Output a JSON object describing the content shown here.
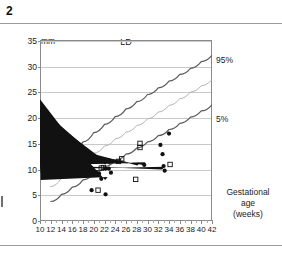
{
  "figure": {
    "number": "2",
    "unit_label": "mm",
    "title": "LD",
    "axis_caption_line1": "Gestational",
    "axis_caption_line2": "age",
    "axis_caption_line3": "(weeks)",
    "label_upper": "95%",
    "label_lower": "5%"
  },
  "chart_data": {
    "type": "scatter",
    "title": "LD",
    "xlabel": "Gestational age (weeks)",
    "ylabel": "mm",
    "xlim": [
      10,
      42
    ],
    "ylim": [
      0,
      35
    ],
    "xticks": [
      10,
      12,
      14,
      16,
      18,
      20,
      22,
      24,
      26,
      28,
      30,
      32,
      34,
      36,
      38,
      40,
      42
    ],
    "yticks": [
      0,
      5,
      10,
      15,
      20,
      25,
      30,
      35
    ],
    "grid": "horizontal",
    "legend": "none",
    "annotations": [
      "95%",
      "5%"
    ],
    "series": [
      {
        "name": "95%",
        "type": "line",
        "color": "#5a5a5a",
        "x": [
          12,
          14,
          16,
          18,
          20,
          22,
          24,
          26,
          28,
          30,
          32,
          34,
          36,
          38,
          40,
          42
        ],
        "y": [
          9.2,
          11.4,
          13.4,
          15.2,
          17.0,
          18.6,
          20.1,
          21.6,
          23.0,
          24.4,
          25.7,
          27.0,
          28.3,
          29.5,
          30.8,
          32.0
        ]
      },
      {
        "name": "50%",
        "type": "line",
        "color": "#b4b4b4",
        "x": [
          12,
          14,
          16,
          18,
          20,
          22,
          24,
          26,
          28,
          30,
          32,
          34,
          36,
          38,
          40,
          42
        ],
        "y": [
          6.5,
          8.2,
          9.9,
          11.5,
          13.0,
          14.4,
          15.8,
          17.1,
          18.4,
          19.7,
          21.0,
          22.3,
          23.6,
          24.9,
          26.1,
          27.3
        ]
      },
      {
        "name": "5%",
        "type": "line",
        "color": "#5a5a5a",
        "x": [
          12,
          14,
          16,
          18,
          20,
          22,
          24,
          26,
          28,
          30,
          32,
          34,
          36,
          38,
          40,
          42
        ],
        "y": [
          3.6,
          5.0,
          6.4,
          7.8,
          9.1,
          10.4,
          11.6,
          12.8,
          14.0,
          15.2,
          16.4,
          17.6,
          18.8,
          20.0,
          21.2,
          22.4
        ]
      },
      {
        "name": "filled-circle-observations",
        "type": "scatter",
        "marker": "filled-circle",
        "color": "#111111",
        "points": [
          [
            19.6,
            5.8
          ],
          [
            22.2,
            5.0
          ],
          [
            21.0,
            9.0
          ],
          [
            21.4,
            8.0
          ],
          [
            22.2,
            10.0
          ],
          [
            22.8,
            10.0
          ],
          [
            23.2,
            9.2
          ],
          [
            20.4,
            9.1
          ],
          [
            29.4,
            10.7
          ],
          [
            32.4,
            14.6
          ],
          [
            34.0,
            16.8
          ],
          [
            32.8,
            12.8
          ],
          [
            33.2,
            9.6
          ],
          [
            33.0,
            10.5
          ]
        ]
      },
      {
        "name": "filled-triangle-observations",
        "type": "scatter",
        "marker": "filled-triangle",
        "color": "#111111",
        "points": [
          [
            22.6,
            10.8
          ],
          [
            23.4,
            10.8
          ],
          [
            22.6,
            7.8
          ],
          [
            28.6,
            10.6
          ],
          [
            29.6,
            10.7
          ],
          [
            33.2,
            9.8
          ],
          [
            21.0,
            9.2
          ]
        ]
      },
      {
        "name": "open-square-observations",
        "type": "scatter",
        "marker": "open-square",
        "color": "#111111",
        "points": [
          [
            20.8,
            5.8
          ],
          [
            20.2,
            9.0
          ],
          [
            21.4,
            10.1
          ],
          [
            21.8,
            10.2
          ],
          [
            24.6,
            11.4
          ],
          [
            25.2,
            11.9
          ],
          [
            28.6,
            14.1
          ],
          [
            28.6,
            14.9
          ],
          [
            27.8,
            7.9
          ],
          [
            34.2,
            10.8
          ]
        ]
      },
      {
        "name": "asterisk-observations",
        "type": "scatter",
        "marker": "asterisk",
        "color": "#111111",
        "points": [
          [
            23.6,
            7.2
          ],
          [
            29.2,
            9.8
          ],
          [
            30.4,
            10.6
          ],
          [
            30.0,
            6.8
          ],
          [
            33.6,
            11.6
          ],
          [
            33.4,
            8.7
          ]
        ]
      }
    ]
  }
}
